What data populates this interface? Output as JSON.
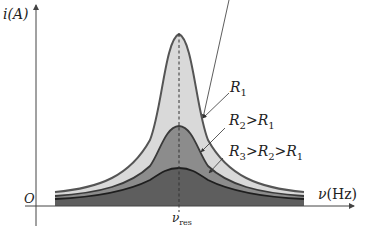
{
  "diagram": {
    "y_axis": {
      "label": "i(A)",
      "label_main": "i",
      "label_unit": "(A)"
    },
    "x_axis": {
      "label": "ν(Hz)",
      "label_main": "ν",
      "label_unit": "(Hz)"
    },
    "origin_label": "O",
    "resonance_marker": {
      "label_main": "ν",
      "label_sub": "res"
    },
    "curves": [
      {
        "id": "R1",
        "label_main": "R",
        "label_sub": "1",
        "label_text": "R1",
        "fill": "#d9d9d9",
        "stroke": "#555555",
        "relative_peak": "highest"
      },
      {
        "id": "R2",
        "label_text": "R2 > R1",
        "parts": [
          "R",
          "2",
          ">R",
          "1"
        ],
        "fill": "#8c8c8c",
        "stroke": "#3a3a3a",
        "relative_peak": "middle"
      },
      {
        "id": "R3",
        "label_text": "R3 > R2 > R1",
        "parts": [
          "R",
          "3",
          ">R",
          "2",
          ">R",
          "1"
        ],
        "fill": "#5e5e5e",
        "stroke": "#1e1e1e",
        "relative_peak": "lowest"
      }
    ],
    "colors": {
      "axis": "#444444",
      "dashed_line": "#333333",
      "background": "#ffffff"
    }
  }
}
